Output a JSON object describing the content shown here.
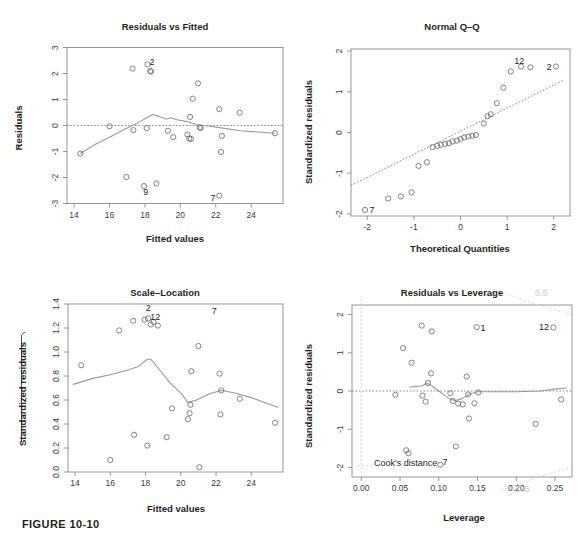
{
  "figure": {
    "caption": "FIGURE 10-10"
  },
  "panels": {
    "residuals_vs_fitted": {
      "title": "Residuals vs Fitted",
      "xlabel": "Fitted values",
      "ylabel": "Residuals"
    },
    "normal_qq": {
      "title": "Normal Q–Q",
      "xlabel": "Theoretical Quantities",
      "ylabel": "Standardized residuals"
    },
    "scale_location": {
      "title": "Scale–Location",
      "xlabel": "Fitted values",
      "ylabel": "Standardized residuals"
    },
    "residuals_vs_leverage": {
      "title": "Residuals vs Leverage",
      "xlabel": "Leverage",
      "ylabel": "Standardized residuals",
      "cooks_label": "Cook's distance",
      "cooks_level_top": "0.5",
      "cooks_level_bottom": "0.5"
    }
  },
  "chart_data": [
    {
      "type": "scatter",
      "id": "residuals-vs-fitted",
      "title": "Residuals vs Fitted",
      "xlabel": "Fitted values",
      "ylabel": "Residuals",
      "xlim": [
        13.6,
        25.8
      ],
      "ylim": [
        -3,
        3
      ],
      "xticks": [
        14,
        16,
        18,
        20,
        22,
        24
      ],
      "yticks": [
        -3,
        -2,
        -1,
        0,
        1,
        2,
        3
      ],
      "grid": false,
      "reference_line": {
        "type": "horizontal-dashed",
        "y": 0
      },
      "points": [
        {
          "x": 14.35,
          "y": -1.08
        },
        {
          "x": 16.0,
          "y": -0.03
        },
        {
          "x": 16.95,
          "y": -1.98
        },
        {
          "x": 17.3,
          "y": 2.19
        },
        {
          "x": 17.35,
          "y": -0.18
        },
        {
          "x": 17.95,
          "y": -2.33
        },
        {
          "x": 18.1,
          "y": -0.1
        },
        {
          "x": 18.15,
          "y": 2.35
        },
        {
          "x": 18.3,
          "y": 2.1
        },
        {
          "x": 18.35,
          "y": 2.07
        },
        {
          "x": 18.65,
          "y": -2.23
        },
        {
          "x": 19.3,
          "y": -0.2
        },
        {
          "x": 19.6,
          "y": -0.45
        },
        {
          "x": 20.4,
          "y": -0.35
        },
        {
          "x": 20.5,
          "y": -0.5
        },
        {
          "x": 20.55,
          "y": 0.33
        },
        {
          "x": 20.6,
          "y": -0.52
        },
        {
          "x": 20.7,
          "y": 1.03
        },
        {
          "x": 21.0,
          "y": 1.62
        },
        {
          "x": 21.1,
          "y": -0.07
        },
        {
          "x": 21.15,
          "y": -0.1
        },
        {
          "x": 22.2,
          "y": 0.63
        },
        {
          "x": 22.3,
          "y": -1.02
        },
        {
          "x": 22.35,
          "y": -0.4
        },
        {
          "x": 22.2,
          "y": -2.7
        },
        {
          "x": 23.35,
          "y": 0.49
        },
        {
          "x": 25.35,
          "y": -0.3
        }
      ],
      "labeled_points": [
        {
          "label": "2",
          "x": 18.4,
          "y": 2.45
        },
        {
          "label": "9",
          "x": 18.05,
          "y": -2.55
        },
        {
          "label": "7",
          "x": 21.85,
          "y": -2.75
        }
      ],
      "loess": [
        [
          14.35,
          -1.08
        ],
        [
          15.2,
          -0.72
        ],
        [
          16.0,
          -0.45
        ],
        [
          17.0,
          -0.1
        ],
        [
          17.6,
          0.1
        ],
        [
          18.1,
          0.3
        ],
        [
          18.45,
          0.42
        ],
        [
          18.8,
          0.35
        ],
        [
          19.2,
          0.25
        ],
        [
          19.5,
          0.3
        ],
        [
          19.8,
          0.22
        ],
        [
          20.4,
          0.15
        ],
        [
          21.0,
          0.02
        ],
        [
          21.6,
          -0.02
        ],
        [
          22.4,
          -0.1
        ],
        [
          23.4,
          -0.2
        ],
        [
          25.35,
          -0.3
        ]
      ]
    },
    {
      "type": "scatter",
      "id": "normal-qq",
      "title": "Normal Q–Q",
      "xlabel": "Theoretical Quantities",
      "ylabel": "Standardized residuals",
      "xlim": [
        -2.35,
        2.35
      ],
      "ylim": [
        -2.05,
        2.05
      ],
      "xticks": [
        -2,
        -1,
        0,
        1,
        2
      ],
      "yticks": [
        -2,
        -1,
        0,
        1,
        2
      ],
      "grid": false,
      "reference_line": {
        "type": "qq-diagonal-dashed",
        "p1": [
          -2.35,
          -1.3
        ],
        "p2": [
          2.2,
          1.28
        ]
      },
      "points": [
        {
          "x": -2.05,
          "y": -1.9
        },
        {
          "x": -1.55,
          "y": -1.62
        },
        {
          "x": -1.28,
          "y": -1.57
        },
        {
          "x": -1.05,
          "y": -1.47
        },
        {
          "x": -0.9,
          "y": -0.82
        },
        {
          "x": -0.72,
          "y": -0.73
        },
        {
          "x": -0.6,
          "y": -0.36
        },
        {
          "x": -0.5,
          "y": -0.33
        },
        {
          "x": -0.42,
          "y": -0.3
        },
        {
          "x": -0.33,
          "y": -0.28
        },
        {
          "x": -0.25,
          "y": -0.26
        },
        {
          "x": -0.17,
          "y": -0.22
        },
        {
          "x": -0.08,
          "y": -0.2
        },
        {
          "x": 0.0,
          "y": -0.16
        },
        {
          "x": 0.08,
          "y": -0.12
        },
        {
          "x": 0.17,
          "y": -0.1
        },
        {
          "x": 0.25,
          "y": -0.08
        },
        {
          "x": 0.33,
          "y": -0.06
        },
        {
          "x": 0.5,
          "y": 0.22
        },
        {
          "x": 0.58,
          "y": 0.4
        },
        {
          "x": 0.65,
          "y": 0.45
        },
        {
          "x": 0.78,
          "y": 0.72
        },
        {
          "x": 0.92,
          "y": 1.1
        },
        {
          "x": 1.08,
          "y": 1.5
        },
        {
          "x": 1.3,
          "y": 1.62
        },
        {
          "x": 1.5,
          "y": 1.6
        },
        {
          "x": 2.05,
          "y": 1.62
        }
      ],
      "labeled_points": [
        {
          "label": "12",
          "x": 1.26,
          "y": 1.77
        },
        {
          "label": "2",
          "x": 1.9,
          "y": 1.62
        },
        {
          "label": "7",
          "x": -1.9,
          "y": -1.9
        }
      ]
    },
    {
      "type": "scatter",
      "id": "scale-location",
      "title": "Scale–Location",
      "xlabel": "Fitted values",
      "ylabel": "Standardized residuals",
      "xlim": [
        13.6,
        25.8
      ],
      "ylim": [
        0.0,
        1.4
      ],
      "xticks": [
        14,
        16,
        18,
        20,
        22,
        24
      ],
      "yticks": [
        0.0,
        0.2,
        0.4,
        0.6,
        0.8,
        1.0,
        1.2,
        1.4
      ],
      "grid": false,
      "points": [
        {
          "x": 14.35,
          "y": 0.89
        },
        {
          "x": 16.0,
          "y": 0.1
        },
        {
          "x": 16.5,
          "y": 1.18
        },
        {
          "x": 17.3,
          "y": 1.26
        },
        {
          "x": 17.35,
          "y": 0.31
        },
        {
          "x": 17.95,
          "y": 1.27
        },
        {
          "x": 18.1,
          "y": 0.22
        },
        {
          "x": 18.15,
          "y": 1.28
        },
        {
          "x": 18.3,
          "y": 1.23
        },
        {
          "x": 18.45,
          "y": 1.25
        },
        {
          "x": 18.7,
          "y": 1.22
        },
        {
          "x": 19.2,
          "y": 0.29
        },
        {
          "x": 19.5,
          "y": 0.53
        },
        {
          "x": 20.4,
          "y": 0.44
        },
        {
          "x": 20.5,
          "y": 0.49
        },
        {
          "x": 20.55,
          "y": 0.56
        },
        {
          "x": 20.6,
          "y": 0.84
        },
        {
          "x": 21.0,
          "y": 1.05
        },
        {
          "x": 21.05,
          "y": 0.04
        },
        {
          "x": 22.2,
          "y": 0.82
        },
        {
          "x": 22.25,
          "y": 0.48
        },
        {
          "x": 22.3,
          "y": 0.68
        },
        {
          "x": 23.35,
          "y": 0.61
        },
        {
          "x": 25.35,
          "y": 0.41
        }
      ],
      "labeled_points": [
        {
          "label": "2",
          "x": 18.15,
          "y": 1.37
        },
        {
          "label": "12",
          "x": 18.55,
          "y": 1.3
        },
        {
          "label": "7",
          "x": 21.9,
          "y": 1.35
        }
      ],
      "loess": [
        [
          13.9,
          0.73
        ],
        [
          15.0,
          0.78
        ],
        [
          16.0,
          0.81
        ],
        [
          17.0,
          0.85
        ],
        [
          17.6,
          0.88
        ],
        [
          18.1,
          0.94
        ],
        [
          18.3,
          0.94
        ],
        [
          18.8,
          0.85
        ],
        [
          19.4,
          0.74
        ],
        [
          20.0,
          0.66
        ],
        [
          20.4,
          0.58
        ],
        [
          20.9,
          0.6
        ],
        [
          21.6,
          0.65
        ],
        [
          22.3,
          0.68
        ],
        [
          23.0,
          0.66
        ],
        [
          24.0,
          0.62
        ],
        [
          25.5,
          0.54
        ]
      ]
    },
    {
      "type": "scatter",
      "id": "residuals-vs-leverage",
      "title": "Residuals vs Leverage",
      "xlabel": "Leverage",
      "ylabel": "Standardized residuals",
      "xlim": [
        -0.012,
        0.272
      ],
      "ylim": [
        -2.25,
        2.25
      ],
      "xticks": [
        0.0,
        0.05,
        0.1,
        0.15,
        0.2,
        0.25
      ],
      "xticklabels": [
        "0.00",
        "0.05",
        "0.10",
        "0.15",
        "0.20",
        "0.25"
      ],
      "yticks": [
        -2,
        -1,
        0,
        1,
        2
      ],
      "grid": false,
      "reference_lines": [
        {
          "type": "horizontal-dashed",
          "y": 0
        },
        {
          "type": "vertical-dashed",
          "x": 0.0
        }
      ],
      "cooks_contours": [
        {
          "level": "0.5",
          "position": "top-right"
        },
        {
          "level": "0.5",
          "position": "bottom-right"
        }
      ],
      "points": [
        {
          "x": 0.044,
          "y": -0.1
        },
        {
          "x": 0.054,
          "y": 1.12
        },
        {
          "x": 0.058,
          "y": -1.55
        },
        {
          "x": 0.061,
          "y": -1.63
        },
        {
          "x": 0.065,
          "y": 0.74
        },
        {
          "x": 0.078,
          "y": 1.71
        },
        {
          "x": 0.079,
          "y": -0.12
        },
        {
          "x": 0.083,
          "y": -0.28
        },
        {
          "x": 0.086,
          "y": 0.21
        },
        {
          "x": 0.09,
          "y": 0.46
        },
        {
          "x": 0.091,
          "y": 1.56
        },
        {
          "x": 0.102,
          "y": -1.93
        },
        {
          "x": 0.115,
          "y": -0.06
        },
        {
          "x": 0.118,
          "y": -0.26
        },
        {
          "x": 0.122,
          "y": -1.45
        },
        {
          "x": 0.125,
          "y": -0.33
        },
        {
          "x": 0.131,
          "y": -0.35
        },
        {
          "x": 0.136,
          "y": 0.38
        },
        {
          "x": 0.138,
          "y": -0.09
        },
        {
          "x": 0.139,
          "y": -0.72
        },
        {
          "x": 0.146,
          "y": -0.32
        },
        {
          "x": 0.151,
          "y": -0.04
        },
        {
          "x": 0.149,
          "y": 1.67
        },
        {
          "x": 0.225,
          "y": -0.86
        },
        {
          "x": 0.248,
          "y": 1.66
        },
        {
          "x": 0.258,
          "y": -0.22
        }
      ],
      "labeled_points": [
        {
          "label": "1",
          "x": 0.157,
          "y": 1.67
        },
        {
          "label": "12",
          "x": 0.236,
          "y": 1.68
        },
        {
          "label": "7",
          "x": 0.108,
          "y": -1.85
        }
      ],
      "loess": [
        [
          0.063,
          0.1
        ],
        [
          0.07,
          0.12
        ],
        [
          0.078,
          0.13
        ],
        [
          0.085,
          0.2
        ],
        [
          0.09,
          0.15
        ],
        [
          0.1,
          0.0
        ],
        [
          0.108,
          -0.12
        ],
        [
          0.115,
          -0.22
        ],
        [
          0.122,
          -0.25
        ],
        [
          0.13,
          -0.2
        ],
        [
          0.14,
          -0.08
        ],
        [
          0.15,
          -0.02
        ],
        [
          0.17,
          -0.02
        ],
        [
          0.2,
          -0.02
        ],
        [
          0.23,
          0.0
        ],
        [
          0.25,
          0.05
        ],
        [
          0.265,
          0.08
        ]
      ]
    }
  ]
}
